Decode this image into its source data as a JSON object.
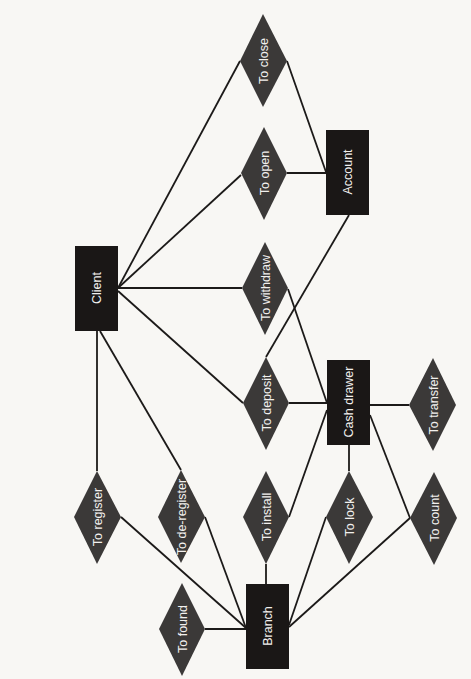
{
  "diagram": {
    "type": "entity-relationship",
    "orientation": "rotated-90",
    "colors": {
      "background": "#f8f7f4",
      "entity_fill": "#1a1716",
      "relationship_fill": "#3b3938",
      "edge": "#1c1a19",
      "label": "#f2f0ee"
    },
    "entities": [
      {
        "id": "client",
        "label": "Client"
      },
      {
        "id": "account",
        "label": "Account"
      },
      {
        "id": "cash_drawer",
        "label": "Cash drawer"
      },
      {
        "id": "branch",
        "label": "Branch"
      }
    ],
    "relationships": [
      {
        "id": "to_close",
        "label": "To close"
      },
      {
        "id": "to_open",
        "label": "To open"
      },
      {
        "id": "to_withdraw",
        "label": "To withdraw"
      },
      {
        "id": "to_deposit",
        "label": "To deposit"
      },
      {
        "id": "to_transfer",
        "label": "To transfer"
      },
      {
        "id": "to_register",
        "label": "To register"
      },
      {
        "id": "to_deregister",
        "label": "To de-register"
      },
      {
        "id": "to_install",
        "label": "To install"
      },
      {
        "id": "to_lock",
        "label": "To lock"
      },
      {
        "id": "to_count",
        "label": "To count"
      },
      {
        "id": "to_found",
        "label": "To found"
      }
    ],
    "edges": [
      {
        "from": "client",
        "to": "to_close"
      },
      {
        "from": "client",
        "to": "to_open"
      },
      {
        "from": "client",
        "to": "to_withdraw"
      },
      {
        "from": "client",
        "to": "to_deposit"
      },
      {
        "from": "client",
        "to": "to_register"
      },
      {
        "from": "client",
        "to": "to_deregister"
      },
      {
        "from": "account",
        "to": "to_close"
      },
      {
        "from": "account",
        "to": "to_open"
      },
      {
        "from": "account",
        "to": "to_deposit"
      },
      {
        "from": "cash_drawer",
        "to": "to_withdraw"
      },
      {
        "from": "cash_drawer",
        "to": "to_deposit"
      },
      {
        "from": "cash_drawer",
        "to": "to_transfer"
      },
      {
        "from": "cash_drawer",
        "to": "to_install"
      },
      {
        "from": "cash_drawer",
        "to": "to_lock"
      },
      {
        "from": "cash_drawer",
        "to": "to_count"
      },
      {
        "from": "branch",
        "to": "to_register"
      },
      {
        "from": "branch",
        "to": "to_deregister"
      },
      {
        "from": "branch",
        "to": "to_install"
      },
      {
        "from": "branch",
        "to": "to_lock"
      },
      {
        "from": "branch",
        "to": "to_count"
      },
      {
        "from": "branch",
        "to": "to_found"
      }
    ]
  }
}
